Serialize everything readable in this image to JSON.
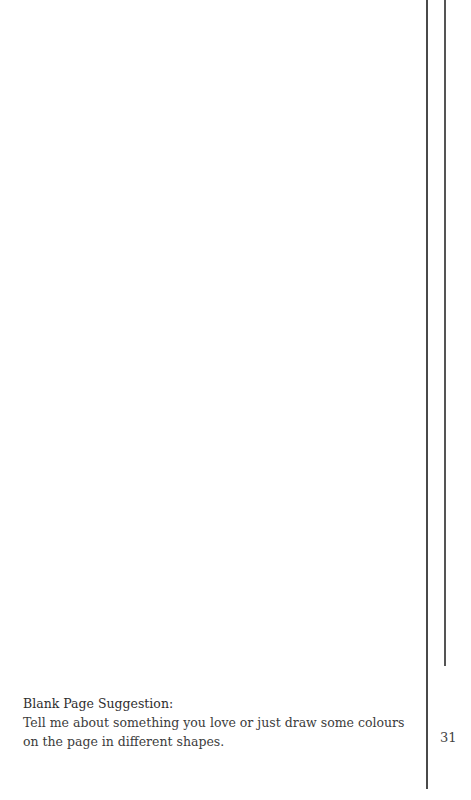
{
  "page": {
    "suggestion_title": "Blank Page Suggestion:",
    "suggestion_body": "Tell me about something you love or just draw some colours on the page in different shapes.",
    "page_number": "31"
  }
}
